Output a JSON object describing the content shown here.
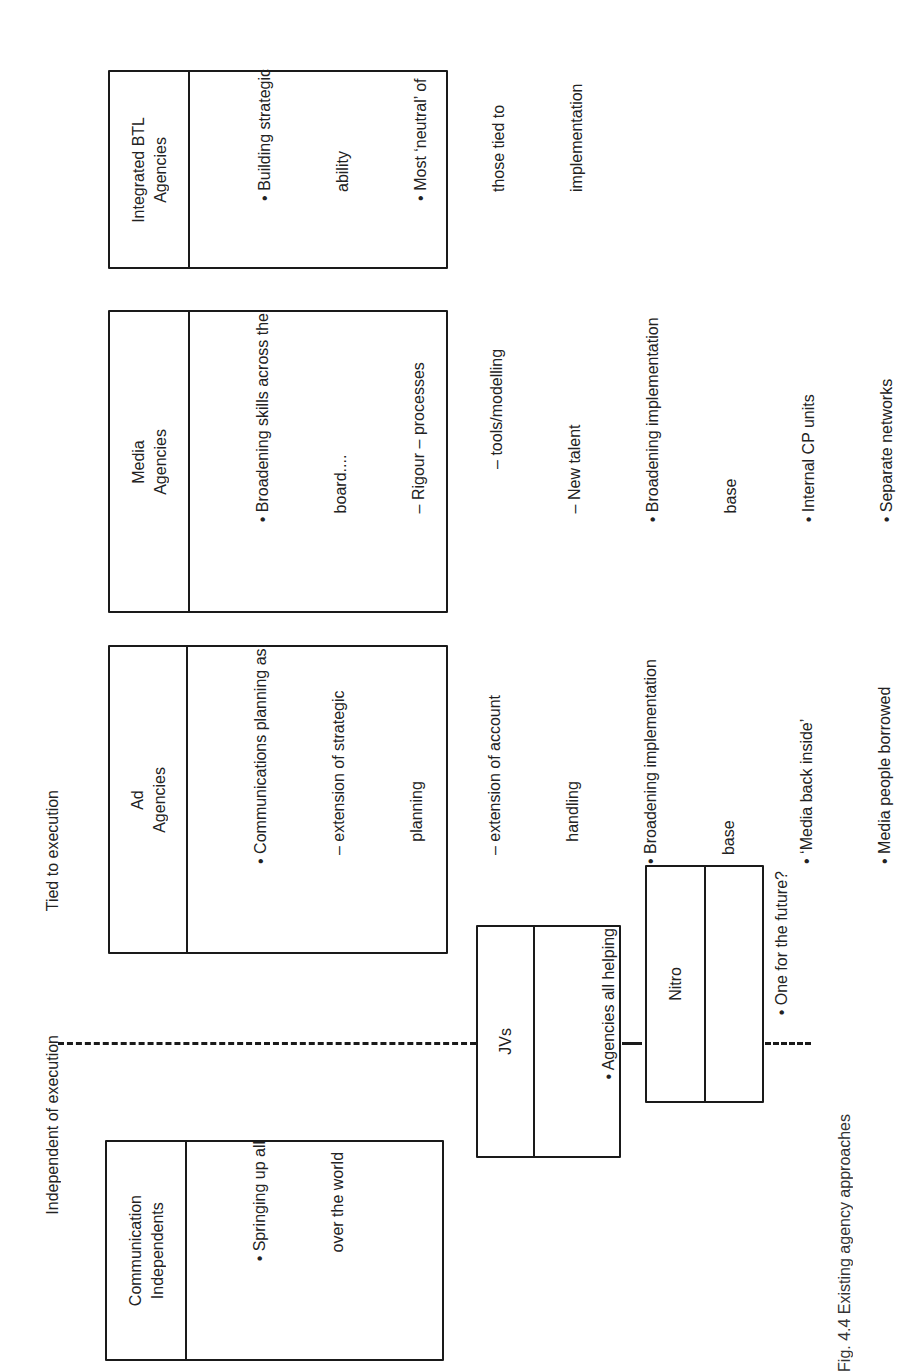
{
  "zones": {
    "tied": "Tied to execution",
    "independent": "Independent of execution"
  },
  "boxes": {
    "btl": {
      "title": [
        "Integrated BTL",
        "Agencies"
      ],
      "lines": [
        "• Building strategic",
        "  ability",
        "• Most ‘neutral’ of",
        "  those tied to",
        "  implementation"
      ]
    },
    "media": {
      "title": [
        "Media",
        "Agencies"
      ],
      "lines": [
        "• Broadening skills across the",
        "  board....",
        "  – Rigour – processes",
        "            – tools/modelling",
        "  – New talent",
        "• Broadening implementation",
        "  base",
        "• Internal CP units",
        "• Separate networks"
      ]
    },
    "ad": {
      "title": [
        "Ad",
        "Agencies"
      ],
      "lines": [
        "• Communications planning as:",
        "  – extension of strategic",
        "     planning",
        "  – extension of account",
        "     handling",
        "• Broadening implementation",
        "  base",
        "• ‘Media back inside’",
        "• Media people borrowed"
      ]
    },
    "independents": {
      "title": [
        "Communication",
        "Independents"
      ],
      "lines": [
        "• Springing up all",
        "  over the world"
      ]
    },
    "jvs": {
      "title": [
        "JVs"
      ],
      "lines": [
        "• Agencies all helping",
        "  each other?"
      ]
    },
    "nitro": {
      "title": [
        "Nitro"
      ],
      "lines": [
        "• One for the future?"
      ]
    }
  },
  "caption": "Fig. 4.4  Existing agency approaches"
}
